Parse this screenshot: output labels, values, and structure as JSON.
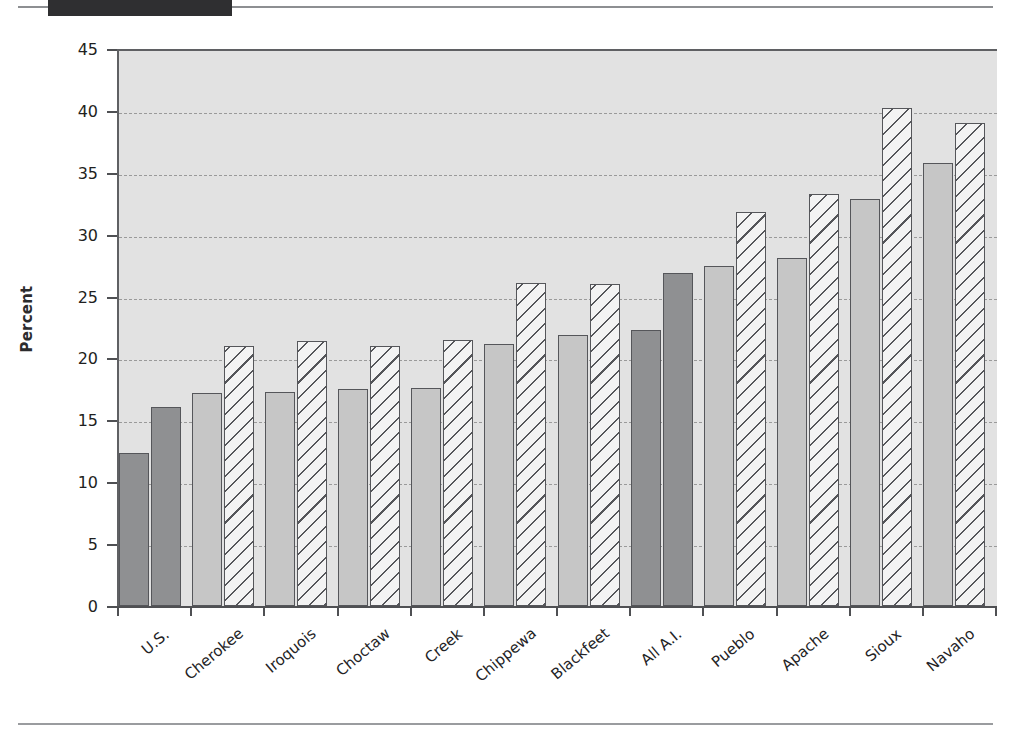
{
  "figure": {
    "title_block": "",
    "y_axis_label": "Percent"
  },
  "chart_data": {
    "type": "bar",
    "title": "",
    "subtitle": "",
    "xlabel": "",
    "ylabel": "Percent",
    "ylim": [
      0,
      45
    ],
    "ytick_step": 5,
    "yticks": [
      0,
      5,
      10,
      15,
      20,
      25,
      30,
      35,
      40,
      45
    ],
    "ytick_labels": [
      "0",
      "5",
      "10",
      "15",
      "20",
      "25",
      "30",
      "35",
      "40",
      "45"
    ],
    "grid": true,
    "grid_axis": "y",
    "grid_style": "dashed",
    "legend": null,
    "legend_position": "none",
    "annotations": [],
    "categories": [
      "U.S.",
      "Cherokee",
      "Iroquois",
      "Choctaw",
      "Creek",
      "Chippewa",
      "Blackfeet",
      "All A.I.",
      "Pueblo",
      "Apache",
      "Sioux",
      "Navaho"
    ],
    "series": [
      {
        "name": "series-1-solid",
        "fill": "solid",
        "values": [
          12.4,
          17.2,
          17.3,
          17.5,
          17.6,
          21.2,
          21.9,
          22.3,
          27.5,
          28.1,
          32.9,
          35.8
        ]
      },
      {
        "name": "series-2-hatched",
        "fill": "diagonal-hatch",
        "values": [
          16.1,
          21.0,
          21.4,
          21.0,
          21.5,
          26.1,
          26.0,
          26.9,
          31.8,
          33.3,
          40.2,
          39.0
        ]
      }
    ],
    "highlighted_categories": [
      "U.S.",
      "All A.I."
    ],
    "colors": {
      "plot_background": "#e2e2e2",
      "bar_solid_light": "#c6c6c6",
      "bar_solid_highlight": "#8f9092",
      "bar_hatch_background": "#f3f3f3",
      "bar_outline": "#55565a",
      "gridline": "#9a9a9a",
      "axis": "#4f5053",
      "text": "#232325",
      "title_block": "#2f2f31",
      "rule": "#8d8f92"
    }
  }
}
